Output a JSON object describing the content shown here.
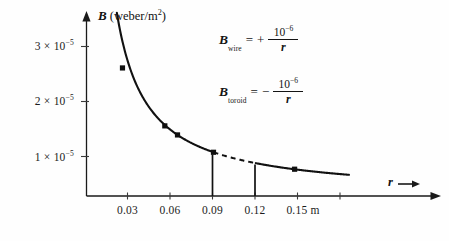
{
  "figure": {
    "background_color": "#fefefe",
    "ink_color": "#111111"
  },
  "chart_data": {
    "type": "line",
    "title": "",
    "subtitle": "",
    "xlabel": "r",
    "ylabel": "B (weber/m²)",
    "y_axis_title_symbol": "B",
    "y_axis_title_units": "(weber/m",
    "y_axis_title_units_exp": "2",
    "y_axis_title_units_close": ")",
    "x_axis_symbol": "r",
    "x_unit_label": "m",
    "xlim": [
      0.0,
      0.192
    ],
    "ylim": [
      0.0,
      4.15e-05
    ],
    "grid": false,
    "legend": null,
    "x_ticks": [
      {
        "value": 0.03,
        "label": "0.03"
      },
      {
        "value": 0.06,
        "label": "0.06"
      },
      {
        "value": 0.09,
        "label": "0.09"
      },
      {
        "value": 0.12,
        "label": "0.12"
      },
      {
        "value": 0.15,
        "label": "0.15 m"
      },
      {
        "value": 0.18,
        "label": ""
      }
    ],
    "y_ticks": [
      {
        "value": 1e-05,
        "mantissa": "1",
        "times": "×",
        "base": "10",
        "exponent": "−5",
        "label": "1 × 10⁻⁵"
      },
      {
        "value": 2e-05,
        "mantissa": "2",
        "times": "×",
        "base": "10",
        "exponent": "−5",
        "label": "2 × 10⁻⁵"
      },
      {
        "value": 3e-05,
        "mantissa": "3",
        "times": "×",
        "base": "10",
        "exponent": "−5",
        "label": "3 × 10⁻⁵"
      }
    ],
    "series": [
      {
        "name": "B = 10^-6 / r",
        "relation": "B = 1e-6 / r",
        "style": "solid-then-dashed",
        "solid_segment_1": {
          "x_start": 0.0215,
          "x_end": 0.09
        },
        "dashed_segment": {
          "x_start": 0.09,
          "x_end": 0.12
        },
        "solid_segment_2": {
          "x_start": 0.12,
          "x_end": 0.186
        },
        "points": [
          {
            "x": 0.0255,
            "y": 3.25e-05
          },
          {
            "x": 0.0555,
            "y": 1.78e-05
          },
          {
            "x": 0.0645,
            "y": 1.55e-05
          },
          {
            "x": 0.09,
            "y": 1.11e-05
          },
          {
            "x": 0.1475,
            "y": 6.8e-06
          }
        ]
      }
    ],
    "drop_lines": [
      {
        "x": 0.09,
        "y_top": 1.11e-05,
        "y_bottom": 0
      },
      {
        "x": 0.12,
        "y_top": 8.4e-06,
        "y_bottom": 0
      }
    ],
    "annotations": [
      {
        "id": "eq-wire",
        "variable": "B",
        "subscript": "wire",
        "equals": "=",
        "sign": "+",
        "numerator": "10",
        "numerator_exponent": "−6",
        "denominator": "r",
        "text": "B_wire = + 10^-6 / r"
      },
      {
        "id": "eq-toroid",
        "variable": "B",
        "subscript": "toroid",
        "equals": "=",
        "sign": "−",
        "numerator": "10",
        "numerator_exponent": "−6",
        "denominator": "r",
        "text": "B_toroid = − 10^-6 / r"
      }
    ]
  }
}
